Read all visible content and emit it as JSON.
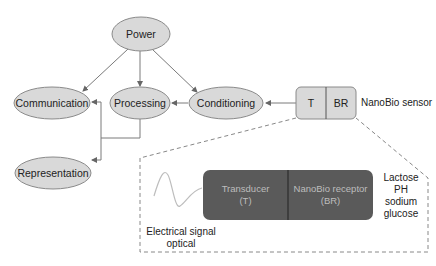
{
  "diagram": {
    "nodes": {
      "power": "Power",
      "communication": "Communication",
      "processing": "Processing",
      "conditioning": "Conditioning",
      "representation": "Representation"
    },
    "sensor": {
      "t_label": "T",
      "br_label": "BR",
      "name": "NanoBio sensor"
    },
    "detail": {
      "transducer_line1": "Transducer",
      "transducer_line2": "(T)",
      "receptor_line1": "NanoBio receptor",
      "receptor_line2": "(BR)",
      "signal_line1": "Electrical signal",
      "signal_line2": "optical",
      "analytes": [
        "Lactose",
        "PH",
        "sodium",
        "glucose"
      ]
    },
    "edges": [
      {
        "from": "Power",
        "to": "Communication"
      },
      {
        "from": "Power",
        "to": "Processing"
      },
      {
        "from": "Power",
        "to": "Conditioning"
      },
      {
        "from": "NanoBio sensor",
        "to": "Conditioning"
      },
      {
        "from": "Conditioning",
        "to": "Processing"
      },
      {
        "from": "Processing",
        "to": "Communication"
      },
      {
        "from": "Processing",
        "to": "Representation"
      }
    ],
    "colors": {
      "node_fill": "#d9d9d9",
      "node_stroke": "#8a8a8a",
      "dark_fill": "#5a5a5a",
      "line": "#7a7a7a"
    }
  }
}
